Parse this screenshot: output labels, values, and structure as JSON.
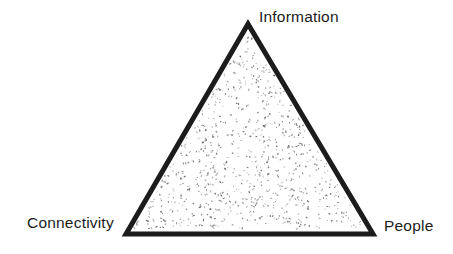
{
  "diagram": {
    "type": "triangle-diagram",
    "labels": {
      "top": "Information",
      "bottom_left": "Connectivity",
      "bottom_right": "People"
    },
    "colors": {
      "outline": "#1c1c1c",
      "fill": "#ffffff",
      "stipple": "#4a4a4a",
      "text": "#1c1c1c",
      "background": "#ffffff"
    }
  }
}
